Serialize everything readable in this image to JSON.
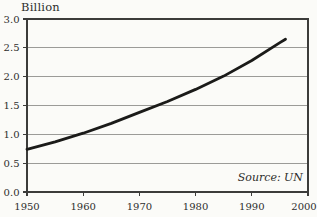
{
  "figure": {
    "unit_label": "Billion",
    "source_note": "Source: UN"
  },
  "colors": {
    "background": "#fbfbf8",
    "frame": "#3c3c3a",
    "gridline": "#9b9b98",
    "tick": "#3c3c3a",
    "curve": "#1b1b19",
    "text": "#2e2e2c"
  },
  "chart_data": {
    "type": "line",
    "title": "",
    "xlabel": "",
    "ylabel": "Billion",
    "source": "Source: UN",
    "xlim": [
      1950,
      2000
    ],
    "ylim": [
      0,
      3
    ],
    "x_ticks": [
      "1950",
      "1960",
      "1970",
      "1980",
      "1990",
      "2000"
    ],
    "y_ticks": [
      "0.0",
      "0.5",
      "1.0",
      "1.5",
      "2.0",
      "2.5",
      "3.0"
    ],
    "grid": "horizontal",
    "legend": "none",
    "x": [
      1950,
      1955,
      1960,
      1965,
      1970,
      1975,
      1980,
      1985,
      1990,
      1995,
      1996
    ],
    "series": [
      {
        "name": "population-billions",
        "values": [
          0.74,
          0.87,
          1.02,
          1.19,
          1.38,
          1.57,
          1.78,
          2.01,
          2.28,
          2.59,
          2.65
        ]
      }
    ]
  }
}
